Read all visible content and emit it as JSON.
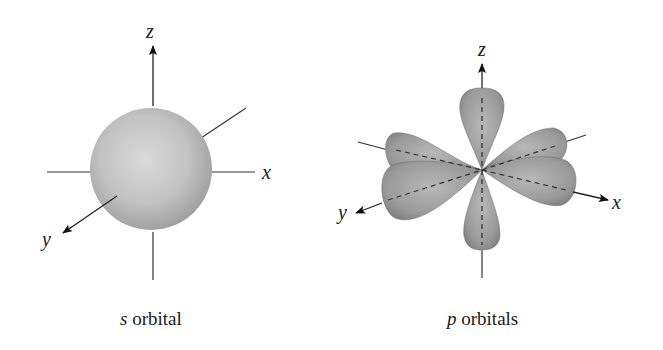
{
  "figure": {
    "panels": [
      {
        "id": "s",
        "caption_italic": "s",
        "caption_rest": " orbital",
        "axes": {
          "z": "z",
          "x": "x",
          "y": "y"
        },
        "shape": "sphere"
      },
      {
        "id": "p",
        "caption_italic": "p",
        "caption_rest": " orbitals",
        "axes": {
          "z": "z",
          "x": "x",
          "y": "y"
        },
        "shape": "three dumbbell lobes along x, y, z"
      }
    ],
    "colors": {
      "sphere_light": "#d8d8d8",
      "sphere_dark": "#9a9a9a",
      "lobe_light": "#b4b4b4",
      "lobe_dark": "#7a7a7a",
      "axis": "#222222"
    }
  }
}
